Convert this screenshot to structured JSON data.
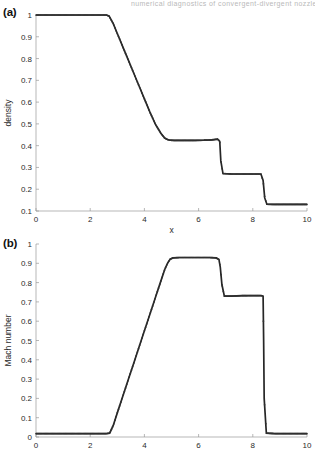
{
  "figure": {
    "header_fragment": "numerical diagnostics of convergent-divergent nozzle flow p",
    "panels": [
      {
        "id": "a",
        "label": "(a)"
      },
      {
        "id": "b",
        "label": "(b)"
      }
    ]
  },
  "chart_data": [
    {
      "type": "line",
      "panel": "(a)",
      "title": "",
      "xlabel": "x",
      "ylabel": "density",
      "xlim": [
        0,
        10
      ],
      "ylim": [
        0.1,
        1
      ],
      "xticks": [
        0,
        2,
        4,
        6,
        8,
        10
      ],
      "xticklabels": [
        "0",
        "2",
        "4",
        "6",
        "8",
        "10"
      ],
      "yticks": [
        0.1,
        0.2,
        0.3,
        0.4,
        0.5,
        0.6,
        0.7,
        0.8,
        0.9,
        1
      ],
      "yticklabels": [
        "0.1",
        "0.2",
        "0.3",
        "0.4",
        "0.5",
        "0.6",
        "0.7",
        "0.8",
        "0.9",
        "1"
      ],
      "grid": false,
      "legend": "none",
      "series": [
        {
          "name": "density",
          "marker": "dot",
          "x": [
            0,
            0.5,
            1.0,
            1.5,
            2.0,
            2.4,
            2.6,
            2.7,
            2.85,
            3.0,
            3.2,
            3.4,
            3.6,
            3.8,
            4.0,
            4.2,
            4.4,
            4.6,
            4.75,
            4.85,
            4.95,
            5.1,
            5.4,
            5.8,
            6.2,
            6.5,
            6.7,
            6.78,
            6.82,
            6.9,
            7.2,
            7.6,
            8.0,
            8.3,
            8.38,
            8.44,
            8.52,
            8.8,
            9.2,
            9.6,
            10
          ],
          "y": [
            1.0,
            1.0,
            1.0,
            1.0,
            1.0,
            1.0,
            1.0,
            0.995,
            0.96,
            0.915,
            0.855,
            0.795,
            0.735,
            0.675,
            0.615,
            0.555,
            0.5,
            0.458,
            0.435,
            0.428,
            0.425,
            0.424,
            0.424,
            0.424,
            0.425,
            0.427,
            0.43,
            0.42,
            0.33,
            0.272,
            0.27,
            0.27,
            0.27,
            0.27,
            0.24,
            0.16,
            0.131,
            0.13,
            0.13,
            0.13,
            0.13
          ]
        }
      ],
      "annotations": [
        {
          "text": "rarefaction-like expansion from x≈2.7",
          "x": 3.8,
          "y": 0.66
        },
        {
          "text": "first shock at x≈6.8",
          "x": 6.8,
          "y": 0.35
        },
        {
          "text": "second shock at x≈8.42",
          "x": 8.42,
          "y": 0.2
        }
      ]
    },
    {
      "type": "line",
      "panel": "(b)",
      "title": "",
      "xlabel": "x",
      "ylabel": "Mach number",
      "xlim": [
        0,
        10
      ],
      "ylim": [
        0,
        1
      ],
      "xticks": [
        0,
        2,
        4,
        6,
        8,
        10
      ],
      "xticklabels": [
        "0",
        "2",
        "4",
        "6",
        "8",
        "10"
      ],
      "yticks": [
        0,
        0.1,
        0.2,
        0.3,
        0.4,
        0.5,
        0.6,
        0.7,
        0.8,
        0.9,
        1
      ],
      "yticklabels": [
        "0",
        "0.1",
        "0.2",
        "0.3",
        "0.4",
        "0.5",
        "0.6",
        "0.7",
        "0.8",
        "0.9",
        "1"
      ],
      "grid": false,
      "legend": "none",
      "series": [
        {
          "name": "Mach number",
          "marker": "dot",
          "x": [
            0,
            0.5,
            1.0,
            1.5,
            2.0,
            2.4,
            2.6,
            2.72,
            2.85,
            3.0,
            3.2,
            3.4,
            3.6,
            3.8,
            4.0,
            4.2,
            4.4,
            4.6,
            4.75,
            4.85,
            4.95,
            5.05,
            5.3,
            5.7,
            6.1,
            6.4,
            6.65,
            6.75,
            6.8,
            6.86,
            6.95,
            7.2,
            7.6,
            8.0,
            8.3,
            8.38,
            8.4,
            8.42,
            8.5,
            8.8,
            9.2,
            9.6,
            10
          ],
          "y": [
            0.018,
            0.018,
            0.018,
            0.018,
            0.018,
            0.018,
            0.018,
            0.02,
            0.06,
            0.125,
            0.21,
            0.295,
            0.38,
            0.465,
            0.55,
            0.635,
            0.72,
            0.805,
            0.868,
            0.9,
            0.921,
            0.928,
            0.93,
            0.93,
            0.93,
            0.93,
            0.928,
            0.92,
            0.88,
            0.79,
            0.73,
            0.73,
            0.732,
            0.733,
            0.733,
            0.73,
            0.5,
            0.2,
            0.02,
            0.018,
            0.018,
            0.018,
            0.018
          ]
        }
      ],
      "annotations": [
        {
          "text": "subsonic inlet plateau M≈0.02",
          "x": 1.3,
          "y": 0.02
        },
        {
          "text": "supersonic plateau M≈0.93",
          "x": 5.9,
          "y": 0.93
        },
        {
          "text": "post-shock plateau M≈0.73",
          "x": 7.6,
          "y": 0.73
        }
      ]
    }
  ]
}
